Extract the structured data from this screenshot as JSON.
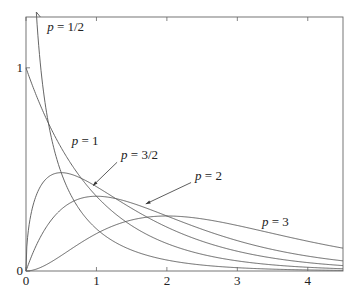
{
  "chart_data": {
    "type": "line",
    "title": "",
    "xlabel": "",
    "ylabel": "",
    "xlim": [
      0,
      4.5
    ],
    "ylim": [
      0,
      1.25
    ],
    "x_ticks": [
      "0",
      "1",
      "2",
      "3",
      "4"
    ],
    "y_ticks": [
      "0",
      "1"
    ],
    "grid": false,
    "legend": "inline labels",
    "series": [
      {
        "name": "p = 1/2",
        "p": 0.5
      },
      {
        "name": "p = 1",
        "p": 1
      },
      {
        "name": "p = 3/2",
        "p": 1.5
      },
      {
        "name": "p = 2",
        "p": 2
      },
      {
        "name": "p = 3",
        "p": 3
      }
    ],
    "annotations": [
      {
        "text": "p = 1/2",
        "x": 0.3,
        "y": 1.18
      },
      {
        "text": "p = 1",
        "x": 0.65,
        "y": 0.62
      },
      {
        "text": "p = 3/2",
        "x": 1.35,
        "y": 0.55,
        "arrow_to": [
          0.95,
          0.42
        ]
      },
      {
        "text": "p = 2",
        "x": 2.4,
        "y": 0.45,
        "arrow_to": [
          1.7,
          0.33
        ]
      },
      {
        "text": "p = 3",
        "x": 3.35,
        "y": 0.22
      }
    ]
  }
}
